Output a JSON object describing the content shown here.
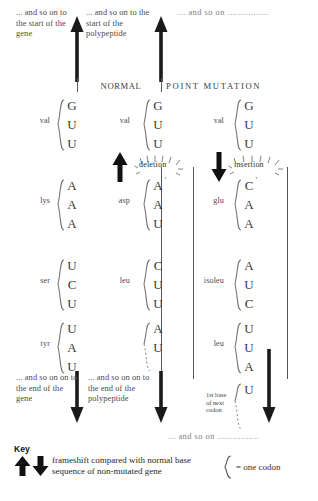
{
  "figure": {
    "headers": {
      "normal": "NORMAL",
      "point_mutation": "POINT MUTATION"
    },
    "top_notes": {
      "gene_start": "... and so on to the start of the gene",
      "polypeptide_start": "... and so on to the start of the polypeptide",
      "right_and_so_on": "... and so on ................"
    },
    "bottom_notes": {
      "gene_end": "... and so on on to the end of the gene",
      "polypeptide_end": "... and so on on to the end of the polypeptide",
      "right_and_so_on": "... and so on ................"
    },
    "mutation_labels": {
      "deletion": "deletion",
      "insertion": "insertion"
    },
    "next_codon_note": "1st base of next codon",
    "columns": [
      {
        "id": "gene",
        "codons": [
          {
            "amino_acid": "val",
            "bases": [
              "G",
              "U",
              "U"
            ]
          },
          {
            "amino_acid": "lys",
            "bases": [
              "A",
              "A",
              "A"
            ]
          },
          {
            "amino_acid": "ser",
            "bases": [
              "U",
              "C",
              "U"
            ]
          },
          {
            "amino_acid": "tyr",
            "bases": [
              "U",
              "A",
              "U"
            ]
          }
        ]
      },
      {
        "id": "deletion",
        "codons": [
          {
            "amino_acid": "val",
            "bases": [
              "G",
              "U",
              "U"
            ]
          },
          {
            "amino_acid": "asp",
            "bases": [
              "A",
              "A",
              "U"
            ]
          },
          {
            "amino_acid": "leu",
            "bases": [
              "C",
              "U",
              "U"
            ]
          },
          {
            "amino_acid": "",
            "bases": [
              "A",
              "U"
            ]
          }
        ]
      },
      {
        "id": "insertion",
        "codons": [
          {
            "amino_acid": "val",
            "bases": [
              "G",
              "U",
              "U"
            ]
          },
          {
            "amino_acid": "glu",
            "bases": [
              "C",
              "A",
              "A"
            ]
          },
          {
            "amino_acid": "isoleu",
            "bases": [
              "A",
              "U",
              "C"
            ]
          },
          {
            "amino_acid": "leu",
            "bases": [
              "U",
              "U",
              "A"
            ]
          },
          {
            "amino_acid": "",
            "bases": [
              "U"
            ]
          }
        ]
      }
    ],
    "key": {
      "title": "Key",
      "arrows_text": "frameshift compared with normal base sequence of non-mutated gene",
      "brace_text": "= one codon"
    }
  }
}
